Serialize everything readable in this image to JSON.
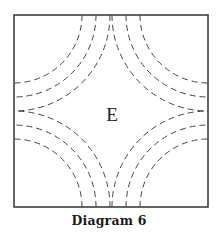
{
  "diagram": {
    "caption": "Diagram 6",
    "region_label": "E",
    "frame": {
      "x": 14,
      "y": 15,
      "width": 194,
      "height": 192,
      "stroke": "#333333"
    },
    "arc_style": {
      "stroke": "#444444",
      "dash": "6 4",
      "width": 1
    },
    "corners": [
      {
        "name": "top-left",
        "cx": 14,
        "cy": 15,
        "radii": [
          68,
          82,
          96
        ]
      },
      {
        "name": "top-right",
        "cx": 208,
        "cy": 15,
        "radii": [
          68,
          82,
          96
        ]
      },
      {
        "name": "bottom-left",
        "cx": 14,
        "cy": 207,
        "radii": [
          68,
          82,
          96
        ]
      },
      {
        "name": "bottom-right",
        "cx": 208,
        "cy": 207,
        "radii": [
          68,
          82,
          96
        ]
      }
    ]
  }
}
